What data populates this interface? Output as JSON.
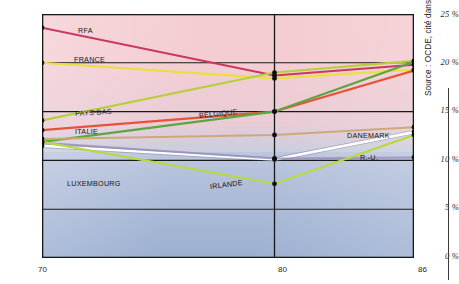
{
  "source_note": "Source : OCDE, cité dans CRES , n° 163.",
  "axes": {
    "y_ticks": [
      "0 %",
      "5 %",
      "10 %",
      "15 %",
      "20 %",
      "25 %"
    ],
    "x_ticks": [
      "70",
      "80",
      "86"
    ]
  },
  "labels": {
    "rfa": "RFA",
    "france": "FRANCE",
    "pays_bas": "PAYS-BAS",
    "italie": "ITALIE",
    "belgique": "BELGIQUE",
    "danemark": "DANEMARK",
    "ru": "R.-U.",
    "luxembourg": "LUXEMBOURG",
    "irlande": "IRLANDE"
  },
  "chart_data": {
    "type": "line",
    "title": "",
    "subtitle": "",
    "xlabel": "",
    "ylabel": "",
    "xlim": [
      70,
      86
    ],
    "ylim": [
      0,
      25
    ],
    "x": [
      70,
      80,
      86
    ],
    "x_tick_labels": [
      "70",
      "80",
      "86"
    ],
    "y_tick_values": [
      0,
      5,
      10,
      15,
      20,
      25
    ],
    "y_tick_labels": [
      "0 %",
      "5 %",
      "10 %",
      "15 %",
      "20 %",
      "25 %"
    ],
    "grid": true,
    "legend": "inline-labels",
    "series": [
      {
        "name": "RFA",
        "color": "#c9395f",
        "values": [
          23.6,
          18.7,
          19.8
        ]
      },
      {
        "name": "FRANCE",
        "color": "#e8e03c",
        "values": [
          20.0,
          18.4,
          19.3
        ]
      },
      {
        "name": "PAYS-BAS",
        "color": "#b6cf3a",
        "values": [
          14.1,
          19.0,
          20.2
        ]
      },
      {
        "name": "ITALIE",
        "color": "#e8513a",
        "values": [
          13.1,
          15.0,
          19.2
        ]
      },
      {
        "name": "BELGIQUE",
        "color": "#5aa641",
        "values": [
          11.9,
          15.0,
          20.1
        ]
      },
      {
        "name": "DANEMARK",
        "color": "#cfa87a",
        "values": [
          12.2,
          12.6,
          13.4
        ]
      },
      {
        "name": "R.-U.",
        "color": "#ffffff",
        "values": [
          11.5,
          10.1,
          12.9
        ]
      },
      {
        "name": "LUXEMBOURG",
        "color": "#9b8fb8",
        "values": [
          11.8,
          10.2,
          10.3
        ]
      },
      {
        "name": "IRLANDE",
        "color": "#b7d944",
        "values": [
          11.9,
          7.6,
          12.6
        ]
      }
    ],
    "annotations": [
      "RFA",
      "FRANCE",
      "PAYS-BAS",
      "ITALIE",
      "BELGIQUE",
      "DANEMARK",
      "R.-U.",
      "LUXEMBOURG",
      "IRLANDE"
    ]
  }
}
